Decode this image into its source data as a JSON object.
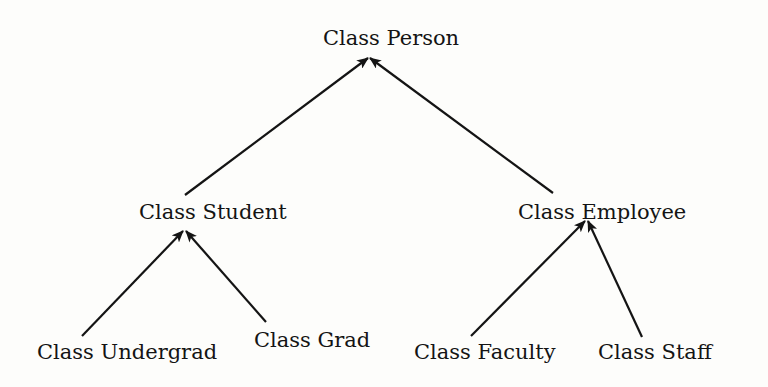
{
  "diagram": {
    "type": "class-hierarchy",
    "nodes": {
      "person": {
        "label": "Class Person",
        "x": 323,
        "y": 28
      },
      "student": {
        "label": "Class Student",
        "x": 139,
        "y": 202
      },
      "employee": {
        "label": "Class Employee",
        "x": 518,
        "y": 202
      },
      "undergrad": {
        "label": "Class Undergrad",
        "x": 37,
        "y": 342
      },
      "grad": {
        "label": "Class Grad",
        "x": 254,
        "y": 330
      },
      "faculty": {
        "label": "Class Faculty",
        "x": 414,
        "y": 342
      },
      "staff": {
        "label": "Class Staff",
        "x": 598,
        "y": 342
      }
    },
    "edges": [
      {
        "from": "student",
        "to": "person",
        "label": "inherits"
      },
      {
        "from": "employee",
        "to": "person",
        "label": "inherits"
      },
      {
        "from": "undergrad",
        "to": "student",
        "label": "inherits"
      },
      {
        "from": "grad",
        "to": "student",
        "label": "inherits"
      },
      {
        "from": "faculty",
        "to": "employee",
        "label": "inherits"
      },
      {
        "from": "staff",
        "to": "employee",
        "label": "inherits"
      }
    ],
    "colors": {
      "line": "#141414",
      "background": "#fdfdfb"
    }
  }
}
